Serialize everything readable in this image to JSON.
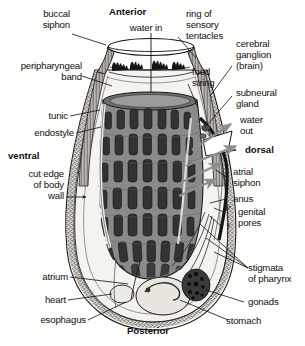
{
  "figure": {
    "style": "grayscale line drawing",
    "colors": {
      "background": "#fdfdfc",
      "ink": "#111111",
      "pharynx_fill": "#8a8a8a",
      "pharynx_slit": "#2f2f2f",
      "tunic_fill": "#e9e7e4",
      "body_wall_stipple": "#6e6b68",
      "arrow_gray": "#8f8f8f",
      "organ_light": "#e4e1da",
      "gonad_dark": "#2b2b2b"
    }
  },
  "orientation": {
    "anterior": "Anterior",
    "posterior": "Posterior",
    "ventral": "ventral",
    "dorsal": "dorsal"
  },
  "labels": {
    "buccal_siphon": "buccal\nsiphon",
    "water_in": "water in",
    "ring_of_sensory_tentacles": "ring of\nsensory\ntentacles",
    "cerebral_ganglion": "cerebral\nganglion\n(brain)",
    "peripharyngeal_band": "peripharyngeal\nband",
    "food_string": "food\nstring",
    "subneural_gland": "subneural\ngland",
    "tunic": "tunic",
    "water_out": "water\nout",
    "endostyle": "endostyle",
    "atrial_siphon": "atrial\nsiphon",
    "cut_edge_of_body_wall": "cut edge\nof body\nwall",
    "anus": "anus",
    "genital_pores": "genital\npores",
    "male_symbol": "♂",
    "female_symbol": "♀",
    "stigmata_of_pharynx": "stigmata\nof pharynx",
    "atrium": "atrium",
    "gonads": "gonads",
    "heart": "heart",
    "stomach": "stomach",
    "esophagus": "esophagus"
  }
}
